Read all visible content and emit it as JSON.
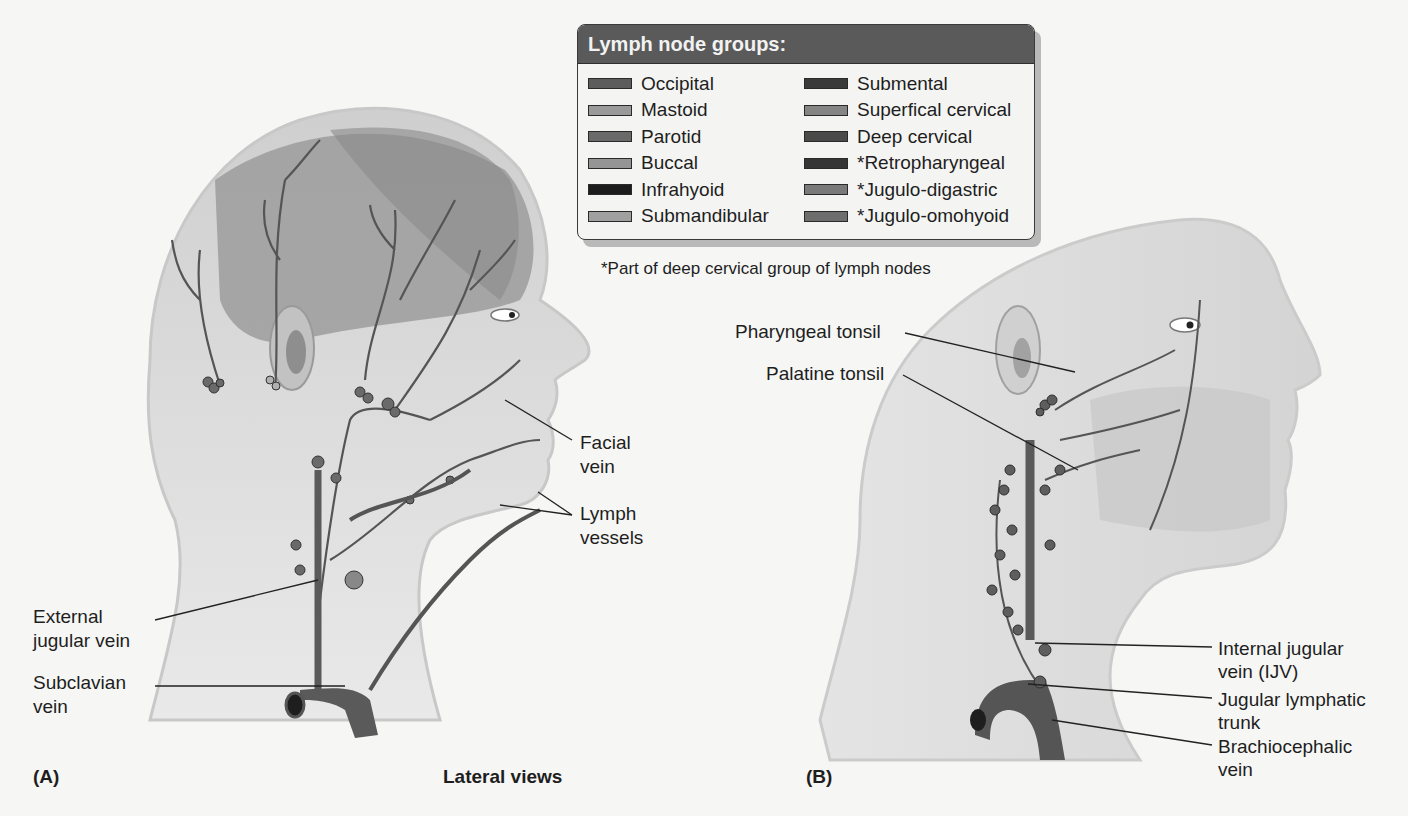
{
  "figure": {
    "caption_center": "Lateral views",
    "panel_a": "(A)",
    "panel_b": "(B)"
  },
  "legend": {
    "title": "Lymph node groups:",
    "items": [
      {
        "label": "Occipital",
        "color": "#5c5c5c"
      },
      {
        "label": "Mastoid",
        "color": "#9a9a9a"
      },
      {
        "label": "Parotid",
        "color": "#6a6a6a"
      },
      {
        "label": "Buccal",
        "color": "#959595"
      },
      {
        "label": "Infrahyoid",
        "color": "#1c1c1c"
      },
      {
        "label": "Submandibular",
        "color": "#a0a0a0"
      },
      {
        "label": "Submental",
        "color": "#3a3a3a"
      },
      {
        "label": "Superfical cervical",
        "color": "#858585"
      },
      {
        "label": "Deep cervical",
        "color": "#4a4a4a"
      },
      {
        "label": "*Retropharyngeal",
        "color": "#353535"
      },
      {
        "label": "*Jugulo-digastric",
        "color": "#7a7a7a"
      },
      {
        "label": "*Jugulo-omohyoid",
        "color": "#6e6e6e"
      }
    ],
    "footnote": "*Part of deep cervical group of lymph nodes"
  },
  "panel_a_labels": {
    "facial_vein_1": "Facial",
    "facial_vein_2": "vein",
    "lymph_vessels_1": "Lymph",
    "lymph_vessels_2": "vessels",
    "external_jugular_1": "External",
    "external_jugular_2": "jugular vein",
    "subclavian_1": "Subclavian",
    "subclavian_2": "vein"
  },
  "panel_b_labels": {
    "pharyngeal_tonsil": "Pharyngeal tonsil",
    "palatine_tonsil": "Palatine tonsil",
    "ijv_1": "Internal jugular",
    "ijv_2": "vein (IJV)",
    "jugular_trunk_1": "Jugular lymphatic",
    "jugular_trunk_2": "trunk",
    "brachiocephalic_1": "Brachiocephalic",
    "brachiocephalic_2": "vein"
  },
  "colors": {
    "vein": "#555555",
    "vessel": "#4a4a4a",
    "skin": "#dcdcdc",
    "scalp": "#9c9c9c"
  }
}
